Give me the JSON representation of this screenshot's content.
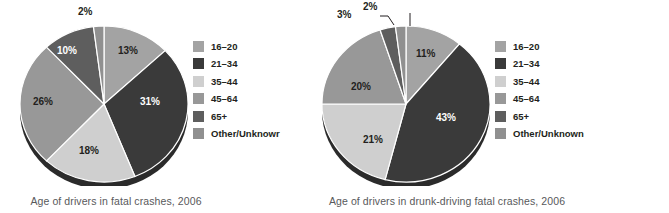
{
  "chart_data": [
    {
      "type": "pie",
      "title": "Age of drivers in fatal crashes, 2006",
      "categories": [
        "16–20",
        "21–34",
        "35–44",
        "45–64",
        "65+",
        "Other/Unknowr"
      ],
      "values": [
        13,
        31,
        18,
        26,
        10,
        2
      ],
      "labels": [
        "13%",
        "31%",
        "18%",
        "26%",
        "10%",
        "2%"
      ],
      "colors": [
        "#a3a3a3",
        "#3a3a3a",
        "#cfcfcf",
        "#989898",
        "#5e5e5e",
        "#909090"
      ],
      "legend_position": "right",
      "grid": false,
      "xlabel": "",
      "ylabel": ""
    },
    {
      "type": "pie",
      "title": "Age of drivers in drunk-driving fatal crashes, 2006",
      "categories": [
        "16–20",
        "21–34",
        "35–44",
        "45–64",
        "65+",
        "Other/Unknown"
      ],
      "values": [
        11,
        43,
        21,
        20,
        3,
        2
      ],
      "labels": [
        "11%",
        "43%",
        "21%",
        "20%",
        "3%",
        "2%"
      ],
      "colors": [
        "#a3a3a3",
        "#3a3a3a",
        "#cfcfcf",
        "#989898",
        "#5e5e5e",
        "#909090"
      ],
      "legend_position": "right",
      "grid": false,
      "xlabel": "",
      "ylabel": ""
    }
  ],
  "panels": [
    {
      "caption": "Age of drivers in fatal crashes, 2006",
      "legend": [
        {
          "label": "16–20",
          "color": "#a3a3a3"
        },
        {
          "label": "21–34",
          "color": "#3a3a3a"
        },
        {
          "label": "35–44",
          "color": "#cfcfcf"
        },
        {
          "label": "45–64",
          "color": "#989898"
        },
        {
          "label": "65+",
          "color": "#5e5e5e"
        },
        {
          "label": "Other/Unknowr",
          "color": "#909090"
        }
      ],
      "slice_labels": [
        "2%",
        "13%",
        "31%",
        "18%",
        "26%",
        "10%"
      ]
    },
    {
      "caption": "Age of drivers in drunk-driving fatal crashes, 2006",
      "legend": [
        {
          "label": "16–20",
          "color": "#a3a3a3"
        },
        {
          "label": "21–34",
          "color": "#3a3a3a"
        },
        {
          "label": "35–44",
          "color": "#cfcfcf"
        },
        {
          "label": "45–64",
          "color": "#989898"
        },
        {
          "label": "65+",
          "color": "#5e5e5e"
        },
        {
          "label": "Other/Unknown",
          "color": "#909090"
        }
      ],
      "slice_labels": [
        "2%",
        "3%",
        "11%",
        "43%",
        "21%",
        "20%"
      ]
    }
  ],
  "source_note": "Source: Created in Excel using data from Traffic Safety Facts Research Note, August 2007, DOT HS 810 821. NHTSA's National Center for Statistics and Analysis. Available from: http://www-nrd.nhtsa.dot.gov/Pubs/810821.pdf"
}
